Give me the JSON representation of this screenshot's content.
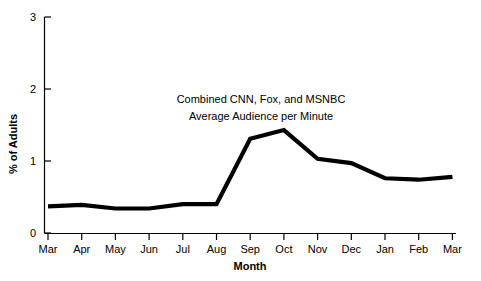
{
  "chart_data": {
    "type": "line",
    "title": "",
    "title_lines": [
      "Combined CNN, Fox, and MSNBC",
      "Average Audience per Minute"
    ],
    "xlabel": "Month",
    "ylabel": "% of Adults",
    "categories": [
      "Mar",
      "Apr",
      "May",
      "Jun",
      "Jul",
      "Aug",
      "Sep",
      "Oct",
      "Nov",
      "Dec",
      "Jan",
      "Feb",
      "Mar"
    ],
    "values": [
      0.37,
      0.39,
      0.34,
      0.34,
      0.4,
      0.4,
      1.31,
      1.43,
      1.03,
      0.97,
      0.76,
      0.74,
      0.78
    ],
    "series": [
      {
        "name": "Combined CNN, Fox, and MSNBC Average Audience per Minute",
        "values": [
          0.37,
          0.39,
          0.34,
          0.34,
          0.4,
          0.4,
          1.31,
          1.43,
          1.03,
          0.97,
          0.76,
          0.74,
          0.78
        ],
        "color": "#000000"
      }
    ],
    "ylim": [
      0,
      3
    ],
    "yticks": [
      0,
      1,
      2,
      3
    ],
    "ytick_labels": [
      "0",
      "1",
      "2",
      "3"
    ],
    "xtick_labels": [
      "Mar",
      "Apr",
      "May",
      "Jun",
      "Jul",
      "Aug",
      "Sep",
      "Oct",
      "Nov",
      "Dec",
      "Jan",
      "Feb",
      "Mar"
    ],
    "grid": false,
    "legend": false,
    "legend_position": "none",
    "line_color": "#000000",
    "background_color": "#ffffff"
  },
  "axes": {
    "y_label": "% of Adults",
    "x_label": "Month"
  },
  "annotations": {
    "title_line_1": "Combined CNN, Fox, and MSNBC",
    "title_line_2": "Average Audience per Minute"
  },
  "ytick_0": "0",
  "ytick_1": "1",
  "ytick_2": "2",
  "ytick_3": "3",
  "xtick_0": "Mar",
  "xtick_1": "Apr",
  "xtick_2": "May",
  "xtick_3": "Jun",
  "xtick_4": "Jul",
  "xtick_5": "Aug",
  "xtick_6": "Sep",
  "xtick_7": "Oct",
  "xtick_8": "Nov",
  "xtick_9": "Dec",
  "xtick_10": "Jan",
  "xtick_11": "Feb",
  "xtick_12": "Mar"
}
